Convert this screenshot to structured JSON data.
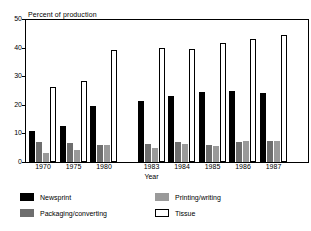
{
  "chart_data": {
    "type": "bar",
    "title": "",
    "ylabel": "Percent of production",
    "xlabel": "Year",
    "ylim": [
      0,
      50
    ],
    "yticks": [
      "0",
      "10",
      "20",
      "30",
      "40",
      "50"
    ],
    "grid": false,
    "legend_position": "bottom",
    "axis_break_after_category": "1980",
    "categories": [
      "1970",
      "1975",
      "1980",
      "1983",
      "1984",
      "1985",
      "1986",
      "1987"
    ],
    "series": [
      {
        "name": "Newsprint",
        "color": "#000000",
        "values": [
          10.8,
          12.7,
          19.5,
          21.2,
          23.1,
          24.5,
          24.7,
          24.0
        ]
      },
      {
        "name": "Packaging/converting",
        "color": "#6e6e6e",
        "values": [
          7.0,
          6.6,
          6.0,
          6.4,
          7.0,
          6.1,
          7.1,
          7.3
        ]
      },
      {
        "name": "Printing/writing",
        "color": "#9a9a9a",
        "values": [
          3.0,
          4.2,
          5.8,
          4.9,
          6.3,
          5.6,
          7.2,
          7.4
        ]
      },
      {
        "name": "Tissue",
        "color": "#ffffff",
        "values": [
          26.2,
          28.3,
          39.1,
          39.9,
          39.4,
          41.7,
          43.1,
          44.5
        ]
      }
    ]
  },
  "legend": {
    "items": [
      {
        "label": "Newsprint",
        "swatch": "newsprint-swatch"
      },
      {
        "label": "Packaging/converting",
        "swatch": "packaging-swatch"
      },
      {
        "label": "Printing/writing",
        "swatch": "printing-swatch"
      },
      {
        "label": "Tissue",
        "swatch": "tissue-swatch"
      }
    ]
  }
}
